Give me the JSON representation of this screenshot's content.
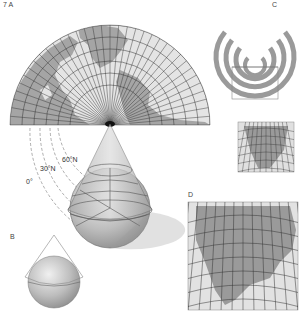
{
  "figure": {
    "panel_labels": {
      "a": "7 A",
      "b": "B",
      "c": "C",
      "d": "D"
    },
    "latitude_labels": [
      "60°N",
      "30°N",
      "0°"
    ],
    "colors": {
      "land": "#9a9a9a",
      "ocean": "#e2e2e2",
      "grid": "#333333",
      "globe": "#b8b8b8",
      "cone": "#c8c8c8",
      "dash": "#777777"
    },
    "panels": [
      {
        "id": "A",
        "description": "Conic projection fan: map unrolled from cone tangent to globe"
      },
      {
        "id": "B",
        "description": "Globe with tangent cone"
      },
      {
        "id": "C",
        "description": "Nested concentric arcs with inset rectangle"
      },
      {
        "id": "C-inset",
        "description": "Small conic map of North America"
      },
      {
        "id": "D",
        "description": "Enlarged conic map of North America"
      }
    ]
  }
}
